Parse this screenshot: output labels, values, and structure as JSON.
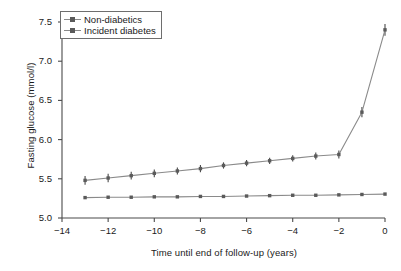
{
  "chart_data": {
    "type": "line",
    "title": "",
    "xlabel": "Time until end of follow-up (years)",
    "ylabel": "Fasting glucose (mmol/l)",
    "xlim": [
      -14,
      0
    ],
    "ylim": [
      5.0,
      7.5
    ],
    "xticks": [
      -14,
      -12,
      -10,
      -8,
      -6,
      -4,
      -2,
      0
    ],
    "xtick_labels": [
      "−14",
      "−12",
      "−10",
      "−8",
      "−6",
      "−4",
      "−2",
      "0"
    ],
    "yticks": [
      5.0,
      5.5,
      6.0,
      6.5,
      7.0,
      7.5
    ],
    "ytick_labels": [
      "5.0",
      "5.5",
      "6.0",
      "6.5",
      "7.0",
      "7.5"
    ],
    "grid": false,
    "legend_position": "upper left",
    "x": [
      -13,
      -12,
      -11,
      -10,
      -9,
      -8,
      -7,
      -6,
      -5,
      -4,
      -3,
      -2,
      -1,
      0
    ],
    "series": [
      {
        "name": "Non-diabetics",
        "color": "#8a8a8a",
        "marker_color": "#5a5a5a",
        "values": [
          5.26,
          5.265,
          5.265,
          5.27,
          5.27,
          5.275,
          5.275,
          5.28,
          5.285,
          5.29,
          5.29,
          5.295,
          5.3,
          5.305
        ],
        "errors": [
          0,
          0,
          0,
          0,
          0,
          0,
          0,
          0,
          0,
          0,
          0,
          0,
          0,
          0
        ]
      },
      {
        "name": "Incident diabetes",
        "color": "#8a8a8a",
        "marker_color": "#5a5a5a",
        "values": [
          5.48,
          5.51,
          5.54,
          5.57,
          5.6,
          5.63,
          5.67,
          5.7,
          5.73,
          5.76,
          5.79,
          5.81,
          6.35,
          7.4
        ],
        "errors": [
          0.055,
          0.055,
          0.05,
          0.05,
          0.045,
          0.045,
          0.04,
          0.04,
          0.04,
          0.04,
          0.045,
          0.05,
          0.065,
          0.075
        ]
      }
    ]
  },
  "legend": {
    "entries": [
      "Non-diabetics",
      "Incident diabetes"
    ]
  },
  "style": {
    "axis_color": "#4a4a4a",
    "line_color": "#8a8a8a",
    "marker_color": "#5a5a5a",
    "background": "#ffffff"
  }
}
